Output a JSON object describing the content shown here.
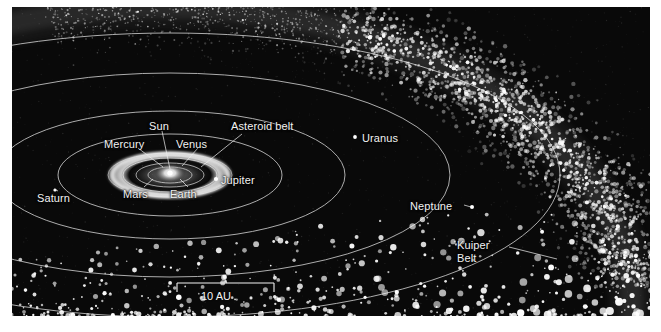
{
  "figure": {
    "kind": "solar-system-diagram",
    "background_color": "#ffffff",
    "plate_color": "#07070a",
    "ink_color": "#f2f2f2"
  },
  "labels": {
    "sun": "Sun",
    "mercury": "Mercury",
    "venus": "Venus",
    "earth": "Earth",
    "mars": "Mars",
    "asteroid_belt": "Asteroid belt",
    "jupiter": "Jupiter",
    "saturn": "Saturn",
    "uranus": "Uranus",
    "neptune": "Neptune",
    "kuiper_belt_line1": "Kuiper",
    "kuiper_belt_line2": "Belt"
  },
  "scale_bar": {
    "text": "10 AU",
    "x_start": 165,
    "x_end": 262,
    "y": 288
  },
  "chart_data": {
    "type": "scatter",
    "title": "",
    "xlabel": "",
    "ylabel": "",
    "projection": "oblique / tilted plan view of the ecliptic plane",
    "scale_reference_au": 10,
    "bodies": [
      {
        "name": "Sun",
        "label": "Sun",
        "marker": "bright core"
      },
      {
        "name": "Mercury",
        "label": "Mercury",
        "marker": "orbit ellipse"
      },
      {
        "name": "Venus",
        "label": "Venus",
        "marker": "orbit ellipse"
      },
      {
        "name": "Earth",
        "label": "Earth",
        "marker": "orbit ellipse"
      },
      {
        "name": "Mars",
        "label": "Mars",
        "marker": "orbit ellipse"
      },
      {
        "name": "Asteroid belt",
        "label": "Asteroid belt",
        "marker": "bright annulus"
      },
      {
        "name": "Jupiter",
        "label": "Jupiter",
        "marker": "dot"
      },
      {
        "name": "Saturn",
        "label": "Saturn",
        "marker": "dot"
      },
      {
        "name": "Uranus",
        "label": "Uranus",
        "marker": "dot"
      },
      {
        "name": "Neptune",
        "label": "Neptune",
        "marker": "dot"
      },
      {
        "name": "Kuiper Belt",
        "label": "Kuiper Belt",
        "marker": "dense speckled arc"
      }
    ],
    "orbit_rings": 6,
    "legend": []
  }
}
